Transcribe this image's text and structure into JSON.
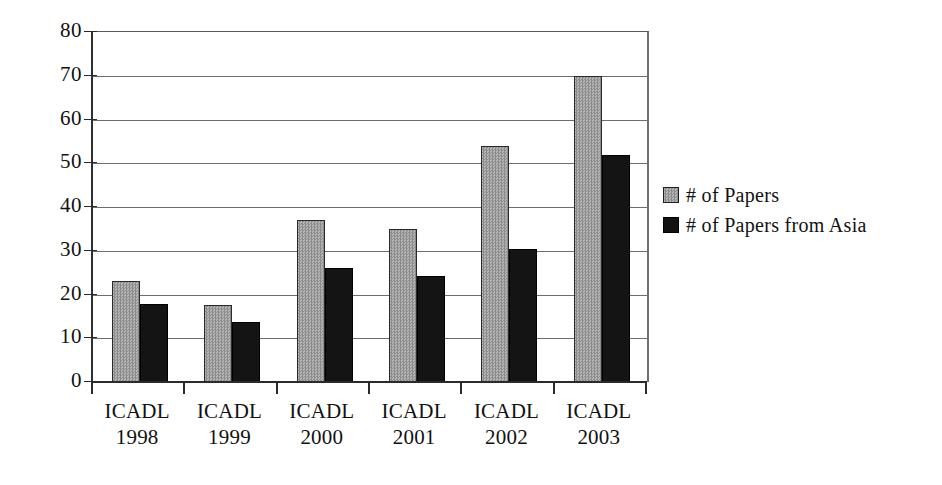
{
  "chart_data": {
    "type": "bar",
    "title": "",
    "subtitle": "",
    "xlabel": "",
    "ylabel": "",
    "ylim": [
      0,
      80
    ],
    "ytick_step": 10,
    "yticks": [
      "0",
      "10",
      "20",
      "30",
      "40",
      "50",
      "60",
      "70",
      "80"
    ],
    "grid": true,
    "grid_axis": "y",
    "legend_position": "right",
    "categories": [
      "ICADL 1998",
      "ICADL 1999",
      "ICADL 2000",
      "ICADL 2001",
      "ICADL 2002",
      "ICADL 2003"
    ],
    "category_lines": [
      {
        "name": "ICADL",
        "year": "1998"
      },
      {
        "name": "ICADL",
        "year": "1999"
      },
      {
        "name": "ICADL",
        "year": "2000"
      },
      {
        "name": "ICADL",
        "year": "2001"
      },
      {
        "name": "ICADL",
        "year": "2002"
      },
      {
        "name": "ICADL",
        "year": "2003"
      }
    ],
    "series": [
      {
        "name": "# of Papers",
        "key": "papers",
        "color": "#9a9a9a",
        "values": [
          23,
          17.6,
          37,
          35,
          54,
          70
        ]
      },
      {
        "name": "# of Papers from Asia",
        "key": "asia",
        "color": "#141414",
        "values": [
          17.8,
          13.7,
          26,
          24.3,
          30.5,
          52
        ]
      }
    ]
  },
  "legend": {
    "items": [
      {
        "label": "# of Papers",
        "swatch": "gray-hatch-swatch"
      },
      {
        "label": "# of Papers from Asia",
        "swatch": "black-swatch"
      }
    ]
  }
}
